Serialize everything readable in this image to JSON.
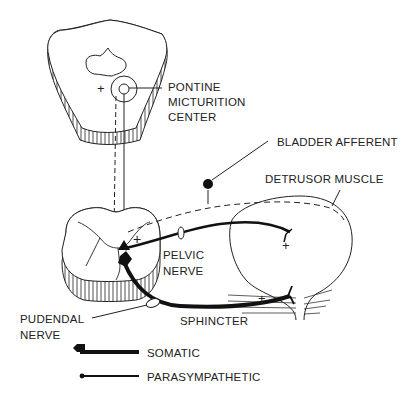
{
  "diagram": {
    "type": "neuroanatomy schematic — micturition pathways",
    "labels": {
      "pmc_line1": "PONTINE",
      "pmc_line2": "MICTURITION",
      "pmc_line3": "CENTER",
      "bladder_afferent": "BLADDER AFFERENT",
      "detrusor": "DETRUSOR MUSCLE",
      "pelvic_line1": "PELVIC",
      "pelvic_line2": "NERVE",
      "pudendal_line1": "PUDENDAL",
      "pudendal_line2": "NERVE",
      "sphincter": "SPHINCTER"
    },
    "signs": {
      "pons_plus": "+",
      "cord_plus": "+",
      "detrusor_plus": "+",
      "sphincter_plus": "+"
    },
    "legend": [
      {
        "key": "somatic",
        "label": "SOMATIC",
        "style": "thick line, diamond terminal"
      },
      {
        "key": "parasympathetic",
        "label": "PARASYMPATHETIC",
        "style": "thin line, dot terminal"
      }
    ],
    "nodes": [
      "pons",
      "pontine micturition center",
      "spinal cord (sacral)",
      "bladder",
      "external sphincter"
    ],
    "edges": [
      {
        "from": "pontine micturition center",
        "to": "spinal cord",
        "style": "solid descending"
      },
      {
        "from": "spinal cord",
        "to": "pontine micturition center",
        "style": "dashed ascending"
      },
      {
        "from": "bladder",
        "to": "spinal cord",
        "label": "BLADDER AFFERENT",
        "style": "dashed"
      },
      {
        "from": "spinal cord",
        "to": "bladder",
        "label": "PELVIC NERVE",
        "style": "parasympathetic"
      },
      {
        "from": "spinal cord",
        "to": "sphincter",
        "label": "PUDENDAL NERVE",
        "style": "somatic"
      }
    ],
    "colors": {
      "ink": "#1a1a1a",
      "background": "#ffffff"
    }
  }
}
